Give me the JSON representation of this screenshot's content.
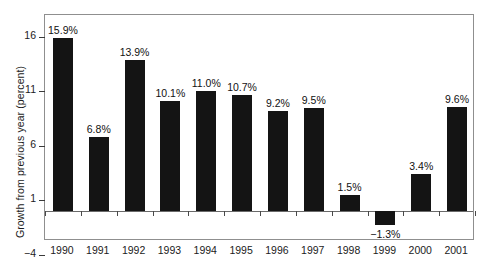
{
  "chart_data": {
    "type": "bar",
    "title": "",
    "xlabel": "",
    "ylabel": "Growth from previous year (percent)",
    "categories": [
      "1990",
      "1991",
      "1992",
      "1993",
      "1994",
      "1995",
      "1996",
      "1997",
      "1998",
      "1999",
      "2000",
      "2001"
    ],
    "values": [
      15.9,
      6.8,
      13.9,
      10.1,
      11.0,
      10.7,
      9.2,
      9.5,
      1.5,
      -1.3,
      3.4,
      9.6
    ],
    "data_labels": [
      "15.9%",
      "6.8%",
      "13.9%",
      "10.1%",
      "11.0%",
      "10.7%",
      "9.2%",
      "9.5%",
      "1.5%",
      "−1.3%",
      "3.4%",
      "9.6%"
    ],
    "ylim": [
      -4,
      18
    ],
    "yticks": [
      16,
      11,
      6,
      1,
      -4
    ],
    "ytick_labels": [
      "16",
      "11",
      "6",
      "1",
      "−4"
    ],
    "grid": false,
    "legend": null,
    "bar_color": "#141414",
    "frame_color": "#8f8f8f",
    "baseline_value": 0
  }
}
